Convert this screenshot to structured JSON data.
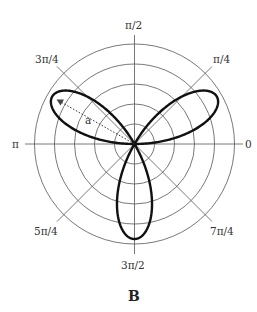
{
  "figure": {
    "caption": "B",
    "center": [
      134.5,
      144
    ],
    "colors": {
      "grid": "#555555",
      "curve": "#111111",
      "text": "#333333",
      "arrow": "#333333"
    }
  },
  "chart_data": {
    "type": "polar",
    "title": "",
    "caption": "B",
    "curve": {
      "name": "three-petal rose",
      "equation": "r = a·sin(3θ)",
      "petals": 3,
      "petal_tip_angles_rad": [
        "π/6",
        "5π/6",
        "3π/2"
      ],
      "amplitude_label": "a",
      "amplitude_px": 95
    },
    "grid": {
      "circles": 5,
      "circle_radii_px": [
        20,
        40,
        60,
        80,
        100
      ],
      "spokes_rad": [
        "0",
        "π/4",
        "π/2",
        "3π/4",
        "π",
        "5π/4",
        "3π/2",
        "7π/4"
      ]
    },
    "angle_labels": [
      {
        "text": "0",
        "angle_deg": 0
      },
      {
        "text": "π/4",
        "angle_deg": 45
      },
      {
        "text": "π/2",
        "angle_deg": 90
      },
      {
        "text": "3π/4",
        "angle_deg": 135
      },
      {
        "text": "π",
        "angle_deg": 180
      },
      {
        "text": "5π/4",
        "angle_deg": 225
      },
      {
        "text": "3π/2",
        "angle_deg": 270
      },
      {
        "text": "7π/4",
        "angle_deg": 315
      }
    ],
    "annotation": {
      "text": "a",
      "type": "dotted-arrow",
      "from": "origin",
      "to_angle": "5π/6"
    }
  },
  "labels": {
    "l0": "0",
    "l45": "π/4",
    "l90": "π/2",
    "l135": "3π/4",
    "l180": "π",
    "l225": "5π/4",
    "l270": "3π/2",
    "l315": "7π/4",
    "a": "a"
  }
}
